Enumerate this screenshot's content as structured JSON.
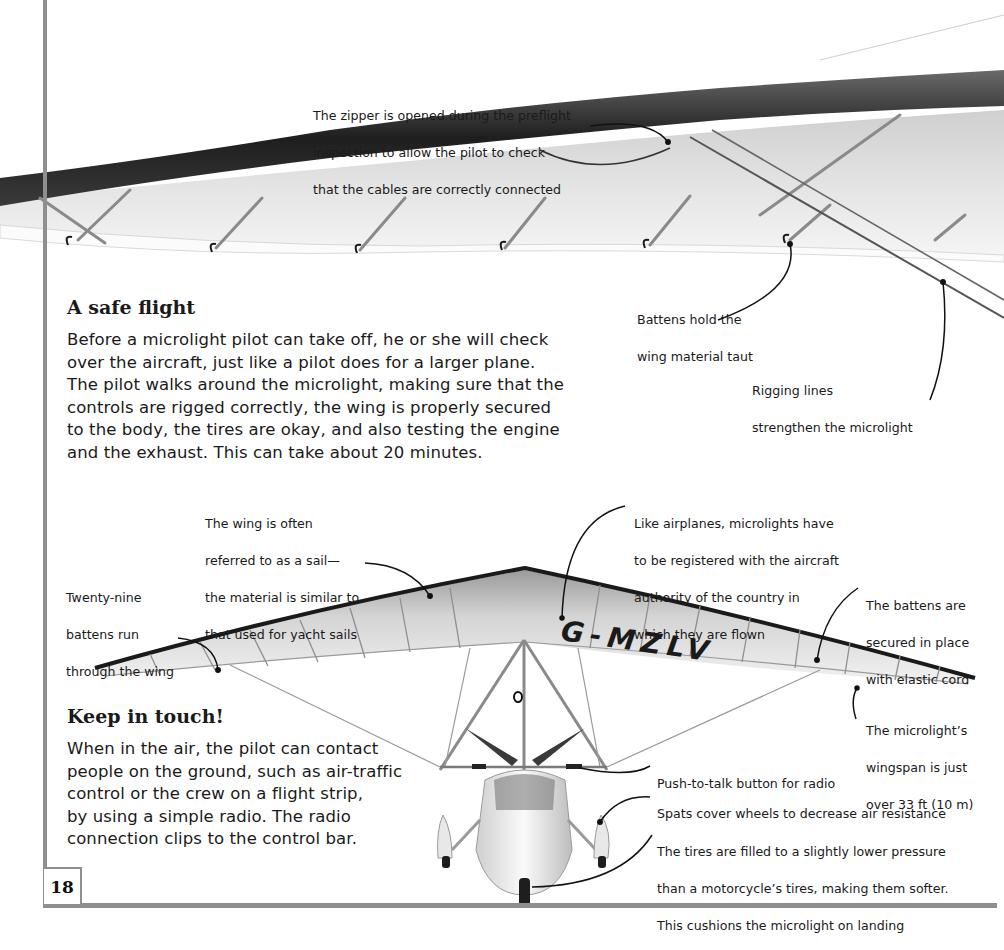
{
  "page": {
    "number": "18",
    "colors": {
      "border": "#8f8f8f",
      "text": "#1a1a1a",
      "background": "#ffffff"
    }
  },
  "sections": [
    {
      "heading": "A safe flight",
      "lines": [
        "Before a microlight pilot can take off, he or she will check",
        "over the aircraft, just like a pilot does for a larger plane.",
        "The pilot walks around the microlight, making sure that the",
        "controls are rigged correctly, the wing is properly secured",
        "to the body, the tires are okay, and also testing the engine",
        "and the exhaust. This can take about 20 minutes."
      ]
    },
    {
      "heading": "Keep in touch!",
      "lines": [
        "When in the air, the pilot can contact",
        "people on the ground, such as air-traffic",
        "control or the crew on a flight strip,",
        "by using a simple radio. The radio",
        "connection clips to the control bar."
      ]
    }
  ],
  "callouts": {
    "zipper": [
      "The zipper is opened during the preflight",
      "inspection to allow the pilot to check",
      "that the cables are correctly connected"
    ],
    "battens_taut": [
      "Battens hold the",
      "wing material taut"
    ],
    "rigging": [
      "Rigging lines",
      "strengthen the microlight"
    ],
    "sail": [
      "The wing is often",
      "referred to as a sail—",
      "the material is similar to",
      "that used for yacht sails"
    ],
    "twenty_nine": [
      "Twenty-nine",
      "battens run",
      "through the wing"
    ],
    "registered": [
      "Like airplanes, microlights have",
      "to be registered with the aircraft",
      "authority of the country in",
      "which they are flown"
    ],
    "elastic": [
      "The battens are",
      "secured in place",
      "with elastic cord"
    ],
    "wingspan": [
      "The microlight’s",
      "wingspan is just",
      "over 33 ft (10 m)"
    ],
    "push_to_talk": [
      "Push-to-talk button for radio"
    ],
    "spats": [
      "Spats cover wheels to decrease air resistance"
    ],
    "tires": [
      "The tires are filled to a slightly lower pressure",
      "than a motorcycle’s tires, making them softer.",
      "This cushions the microlight on landing"
    ]
  },
  "illustration": {
    "registration": "G-MZLV",
    "top_image": "microlight wing underside close-up",
    "bottom_image": "microlight front view"
  }
}
